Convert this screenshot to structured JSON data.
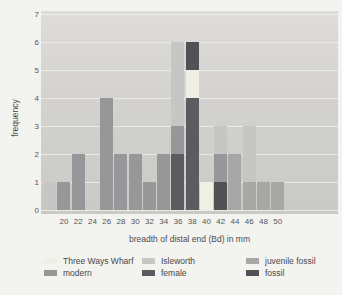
{
  "chart_data": {
    "type": "bar",
    "stacked": true,
    "title": "",
    "xlabel": "breadth of distal end (Bd) in mm",
    "ylabel": "frequency",
    "xticks": [
      20,
      22,
      24,
      26,
      28,
      30,
      32,
      34,
      36,
      38,
      40,
      42,
      44,
      46,
      48,
      50
    ],
    "yticks": [
      0,
      1,
      2,
      3,
      4,
      5,
      6,
      7
    ],
    "xlim": [
      16.8,
      58.5
    ],
    "ylim": [
      0,
      7
    ],
    "grid": true,
    "legend_position": "bottom",
    "series": {
      "three_ways_wharf": {
        "label": "Three Ways Wharf",
        "color": "#efefe4"
      },
      "modern": {
        "label": "modern",
        "color": "#97979a"
      },
      "isleworth": {
        "label": "Isleworth",
        "color": "#c5c7c4"
      },
      "female": {
        "label": "female",
        "color": "#5c5c60"
      },
      "juvenile_fossil": {
        "label": "juvenile fossil",
        "color": "#a7a7a5"
      },
      "fossil": {
        "label": "fossil",
        "color": "#515156"
      }
    },
    "legend_columns": [
      [
        "three_ways_wharf",
        "modern"
      ],
      [
        "isleworth",
        "female"
      ],
      [
        "juvenile_fossil",
        "fossil"
      ]
    ],
    "bars": [
      {
        "x": 18,
        "segments": [
          {
            "series": "isleworth",
            "value": 1
          }
        ]
      },
      {
        "x": 20,
        "segments": [
          {
            "series": "modern",
            "value": 1
          }
        ]
      },
      {
        "x": 22,
        "segments": [
          {
            "series": "modern",
            "value": 2
          }
        ]
      },
      {
        "x": 24,
        "segments": []
      },
      {
        "x": 26,
        "segments": [
          {
            "series": "modern",
            "value": 4
          }
        ]
      },
      {
        "x": 28,
        "segments": [
          {
            "series": "modern",
            "value": 2
          }
        ]
      },
      {
        "x": 30,
        "segments": [
          {
            "series": "modern",
            "value": 2
          }
        ]
      },
      {
        "x": 32,
        "segments": [
          {
            "series": "modern",
            "value": 1
          }
        ]
      },
      {
        "x": 34,
        "segments": [
          {
            "series": "modern",
            "value": 2
          }
        ]
      },
      {
        "x": 36,
        "segments": [
          {
            "series": "female",
            "value": 2
          },
          {
            "series": "modern",
            "value": 1
          },
          {
            "series": "isleworth",
            "value": 3
          }
        ]
      },
      {
        "x": 38,
        "segments": [
          {
            "series": "female",
            "value": 4
          },
          {
            "series": "three_ways_wharf",
            "value": 1
          },
          {
            "series": "fossil",
            "value": 1
          }
        ]
      },
      {
        "x": 40,
        "segments": [
          {
            "series": "three_ways_wharf",
            "value": 1
          }
        ]
      },
      {
        "x": 42,
        "segments": [
          {
            "series": "fossil",
            "value": 1
          },
          {
            "series": "modern",
            "value": 1
          },
          {
            "series": "isleworth",
            "value": 1
          }
        ]
      },
      {
        "x": 44,
        "segments": [
          {
            "series": "juvenile_fossil",
            "value": 2
          }
        ]
      },
      {
        "x": 46,
        "segments": [
          {
            "series": "juvenile_fossil",
            "value": 1
          },
          {
            "series": "isleworth",
            "value": 2
          }
        ]
      },
      {
        "x": 48,
        "segments": [
          {
            "series": "juvenile_fossil",
            "value": 1
          }
        ]
      },
      {
        "x": 50,
        "segments": [
          {
            "series": "juvenile_fossil",
            "value": 1
          }
        ]
      }
    ]
  }
}
